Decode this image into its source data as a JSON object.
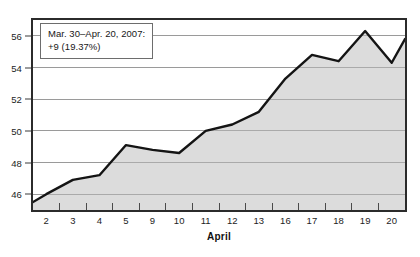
{
  "chart_data": {
    "type": "area",
    "title": "",
    "xlabel": "April",
    "ylabel": "",
    "categories": [
      "2",
      "3",
      "4",
      "5",
      "9",
      "10",
      "11",
      "12",
      "13",
      "16",
      "17",
      "18",
      "19",
      "20"
    ],
    "values": [
      46.0,
      46.9,
      47.2,
      49.1,
      48.8,
      48.6,
      50.0,
      50.4,
      51.2,
      53.3,
      54.8,
      54.4,
      56.3,
      54.3
    ],
    "series": [
      {
        "name": "Price",
        "values": [
          46.0,
          46.9,
          47.2,
          49.1,
          48.8,
          48.6,
          50.0,
          50.4,
          51.2,
          53.3,
          54.8,
          54.4,
          56.3,
          54.3
        ]
      }
    ],
    "start_value": 45.5,
    "end_value": 55.8,
    "yticks": [
      46,
      48,
      50,
      52,
      54,
      56
    ],
    "ylim": [
      45.0,
      57.0
    ],
    "grid": true,
    "legend": "none",
    "line_color": "#141414",
    "fill_color": "#dcdcdc",
    "grid_color": "#9a9a9a",
    "border_color": "#2b2b2b"
  },
  "annotation": {
    "name": "range-callout",
    "line1": "Mar. 30–Apr. 20, 2007:",
    "line2": "+9 (19.37%)"
  },
  "axis": {
    "x_title": "April"
  }
}
